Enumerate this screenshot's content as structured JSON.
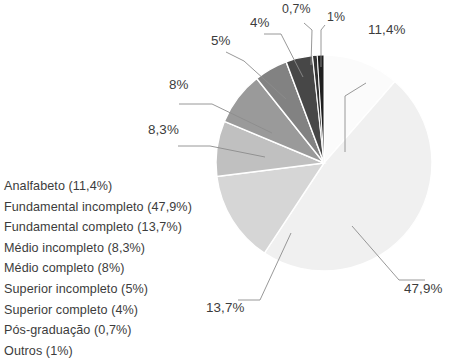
{
  "legend": {
    "items": [
      "Analfabeto (11,4%)",
      "Fundamental incompleto (47,9%)",
      "Fundamental completo (13,7%)",
      "Médio incompleto (8,3%)",
      "Médio completo (8%)",
      "Superior incompleto (5%)",
      "Superior completo (4%)",
      "Pós-graduação (0,7%)",
      "Outros (1%)"
    ]
  },
  "data_labels": {
    "analfabeto": "11,4%",
    "fundamental_incompleto": "47,9%",
    "fundamental_completo": "13,7%",
    "medio_incompleto": "8,3%",
    "medio_completo": "8%",
    "superior_incompleto": "5%",
    "superior_completo": "4%",
    "pos_graduacao": "0,7%",
    "outros": "1%"
  },
  "chart_data": {
    "type": "pie",
    "title": "",
    "categories": [
      "Analfabeto",
      "Fundamental incompleto",
      "Fundamental completo",
      "Médio incompleto",
      "Médio completo",
      "Superior incompleto",
      "Superior completo",
      "Pós-graduação",
      "Outros"
    ],
    "values": [
      11.4,
      47.9,
      13.7,
      8.3,
      8,
      5,
      4,
      0.7,
      1
    ],
    "value_labels": [
      "11,4%",
      "47,9%",
      "13,7%",
      "8,3%",
      "8%",
      "5%",
      "4%",
      "0,7%",
      "1%"
    ],
    "unit": "%",
    "start_angle_deg": 0,
    "direction": "clockwise",
    "legend_position": "left",
    "grid": false,
    "colors": [
      "#fbfbfb",
      "#f0f0f0",
      "#d6d6d6",
      "#c0c0c0",
      "#9a9a9a",
      "#828282",
      "#474747",
      "#333333",
      "#1f1f1f"
    ],
    "slice_border_color": "#ffffff"
  }
}
